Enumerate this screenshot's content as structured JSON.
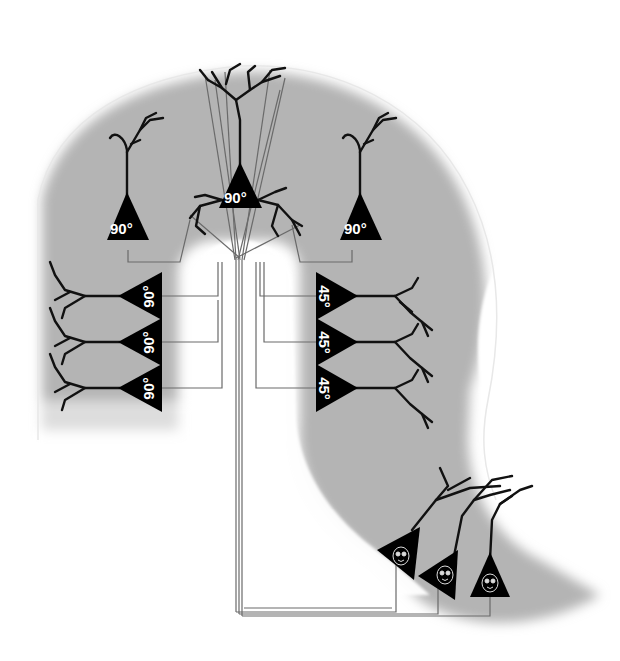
{
  "diagram": {
    "type": "neural-circuit-schematic",
    "colors": {
      "tissue": "#b4b4b4",
      "soma": "#000000",
      "dendrite": "#111111",
      "wire": "#6a6a6a",
      "background": "#ffffff",
      "label": "#ffffff"
    },
    "top_neurons": [
      {
        "id": "top-left",
        "label": "90°"
      },
      {
        "id": "top-center",
        "label": "90°"
      },
      {
        "id": "top-right",
        "label": "90°"
      }
    ],
    "left_column": [
      {
        "id": "left-1",
        "label": "90°"
      },
      {
        "id": "left-2",
        "label": "90°"
      },
      {
        "id": "left-3",
        "label": "90°"
      }
    ],
    "right_column": [
      {
        "id": "right-1",
        "label": "45°"
      },
      {
        "id": "right-2",
        "label": "45°"
      },
      {
        "id": "right-3",
        "label": "45°"
      }
    ],
    "bottom_cluster": [
      {
        "id": "bottom-1",
        "icon": "face-icon"
      },
      {
        "id": "bottom-2",
        "icon": "face-icon"
      },
      {
        "id": "bottom-3",
        "icon": "face-icon"
      }
    ]
  }
}
